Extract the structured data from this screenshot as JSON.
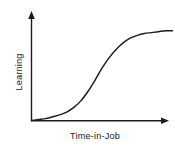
{
  "chart_data": {
    "type": "line",
    "title": "",
    "subtitle": "",
    "xlabel": "Time-in-Job",
    "ylabel": "Learning",
    "xlim": [
      0,
      100
    ],
    "ylim": [
      0,
      100
    ],
    "grid": false,
    "legend": null,
    "axis_ticks": "none",
    "annotations": [],
    "series": [
      {
        "name": "Learning curve",
        "color": "#1b1b1b",
        "x": [
          0,
          5,
          10,
          15,
          20,
          25,
          30,
          35,
          40,
          45,
          50,
          55,
          60,
          65,
          70,
          75,
          80,
          85,
          90,
          95,
          100
        ],
        "y": [
          0,
          1,
          2,
          4,
          6,
          9,
          14,
          21,
          31,
          43,
          56,
          67,
          76,
          83,
          88,
          91,
          93,
          94,
          95,
          96,
          96
        ]
      }
    ]
  },
  "axes": {
    "y_axis_label": "Learning",
    "x_axis_label": "Time-in-Job",
    "y_arrow": "arrow-up-icon",
    "x_arrow": "arrow-right-icon"
  },
  "colors": {
    "line": "#1b1b1b",
    "axis": "#1b1b1b",
    "text": "#1b1b1b",
    "background": "#ffffff"
  }
}
